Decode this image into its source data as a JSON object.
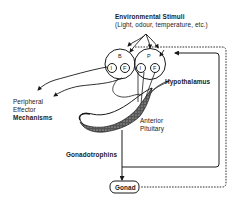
{
  "diagram": {
    "title_top": "Environmental Stimuli",
    "title_sub": "(Light, odour, temperature, etc.)",
    "nodes": {
      "brain_left": {
        "label": "B",
        "inner_left": "I",
        "inner_right": "F"
      },
      "brain_right": {
        "label": "P",
        "inner_left": "I",
        "inner_right": "F"
      }
    },
    "labels": {
      "hypothalamus": "Hypothalamus",
      "anterior": "Anterior",
      "pituitary": "Pituitary",
      "peripheral": "Peripheral",
      "effector": "Effector",
      "mechanisms": "Mechanisms",
      "gonadotrophins": "Gonadotrophins",
      "gonad": "Gonad"
    },
    "colors": {
      "ink": "#1a1a1a",
      "background": "#ffffff"
    }
  }
}
